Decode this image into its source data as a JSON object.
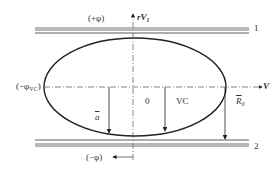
{
  "diagram": {
    "labels": {
      "plus_phi": "(+φ)",
      "minus_phi": "(−φ)",
      "minus_phi_vc_prefix": "(−φ",
      "minus_phi_vc_sub": "VC",
      "minus_phi_vc_suffix": ")",
      "rV1_r": "r",
      "rV1_V": "V",
      "rV1_sub": "1",
      "V_axis": "V",
      "zero": "0",
      "VC": "VC",
      "a_bar": "a",
      "R0_R": "R",
      "R0_sub": "0",
      "band_1": "1",
      "band_2": "2"
    },
    "colors": {
      "band_fill": "#b8b8b8",
      "line": "#222222",
      "dash": "#555555"
    }
  }
}
